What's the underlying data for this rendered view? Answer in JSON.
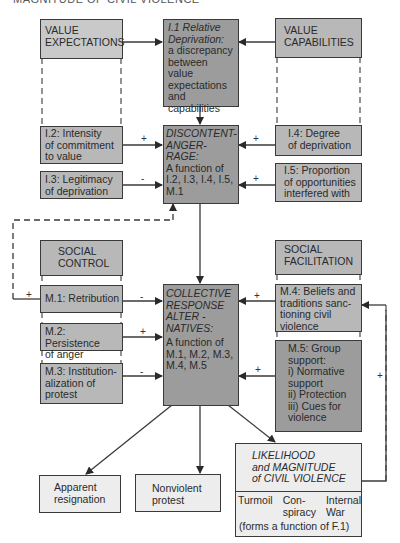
{
  "title": "MAGNITUDE OF CIVIL VIOLENCE",
  "nodes": {
    "value_expectations": {
      "label": "VALUE\nEXPECTATIONS"
    },
    "value_capabilities": {
      "label": "VALUE\nCAPABILITIES"
    },
    "relative_deprivation": {
      "heading": "I.1 Relative\nDeprivation:",
      "body": "a discrepancy\nbetween value\nexpectations\nand\ncapabilities"
    },
    "i2": {
      "label": "I.2: Intensity\nof commitment\nto value"
    },
    "i3": {
      "label": "I.3: Legitimacy\nof deprivation"
    },
    "i4": {
      "label": "I.4: Degree\nof deprivation"
    },
    "i5": {
      "label": "I.5: Proportion\nof opportunities\ninterfered with"
    },
    "discontent": {
      "heading": "DISCONTENT-\nANGER-\nRAGE:",
      "body": "A function of\nI.2, I.3, I.4, I.5,\nM.1"
    },
    "social_control": {
      "label": "SOCIAL\nCONTROL"
    },
    "social_facilitation": {
      "label": "SOCIAL\nFACILITATION"
    },
    "m1": {
      "label": "M.1: Retribution"
    },
    "m2": {
      "label": "M.2: Persistence\nof anger"
    },
    "m3": {
      "label": "M.3: Institution-\nalization of\nprotest"
    },
    "m4": {
      "label": "M.4: Beliefs and\ntraditions sanc-\ntioning civil\nviolence"
    },
    "m5": {
      "label": "M.5: Group\nsupport:\ni) Normative\nsupport\nii) Protection\niii) Cues for\nviolence"
    },
    "collective": {
      "heading": "COLLECTIVE\nRESPONSE\nALTER -\nNATIVES:",
      "body": "A function of\nM.1, M.2, M.3,\nM.4, M.5"
    },
    "apparent_resignation": {
      "label": "Apparent\nresignation"
    },
    "nonviolent_protest": {
      "label": "Nonviolent\nprotest"
    },
    "civil_violence": {
      "heading": "LIKELIHOOD\nand MAGNITUDE\nof CIVIL VIOLENCE",
      "types": [
        "Turmoil",
        "Con-\nspiracy",
        "Internal\nWar"
      ],
      "footnote": "(forms a function of F.1)"
    }
  },
  "signs": {
    "i2_to_discontent": "+",
    "i3_to_discontent": "-",
    "i4_to_discontent": "+",
    "i5_to_discontent": "+",
    "feedback_m1": "+",
    "m1_to_collective": "-",
    "m2_to_collective": "+",
    "m3_to_collective": "-",
    "m4_to_collective": "+",
    "m5_to_collective": "+",
    "feedback_violence_to_m4": "+"
  }
}
